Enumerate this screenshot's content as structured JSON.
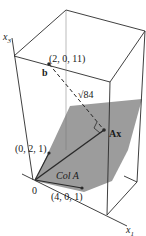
{
  "figure": {
    "axes": {
      "x3_label": "x",
      "x3_sub": "3",
      "x1_label": "x",
      "x1_sub": "1",
      "origin_label": "0"
    },
    "points": {
      "b": {
        "label": "b",
        "coords": "(2, 0, 11)"
      },
      "Ax": {
        "label": "Ax"
      },
      "col1": {
        "coords": "(0, 2, 1)"
      },
      "col2": {
        "coords": "(4, 0, 1)"
      }
    },
    "distance_label": "√84",
    "plane_label": "Col A",
    "colors": {
      "plane": "#9a9a9a",
      "line": "#2a2a2a",
      "background": "#ffffff"
    }
  }
}
